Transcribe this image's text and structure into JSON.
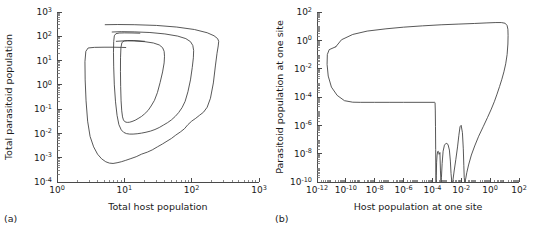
{
  "figure": {
    "background": "#ffffff",
    "line_color": "#3a3a3a",
    "axis_color": "#4a4a4a"
  },
  "panels": [
    {
      "id": "a",
      "label": "(a)",
      "xlabel": "Total host population",
      "ylabel": "Total parasitoid population",
      "xticks": [
        "10^0",
        "10^1",
        "10^2",
        "10^3"
      ],
      "yticks": [
        "10^-4",
        "10^-3",
        "10^-2",
        "10^-1",
        "10^0",
        "10^1",
        "10^2",
        "10^3"
      ]
    },
    {
      "id": "b",
      "label": "(b)",
      "xlabel": "Host population at one site",
      "ylabel": "Parasitoid population at one site",
      "xticks": [
        "10^-12",
        "10^-10",
        "10^-8",
        "10^-6",
        "10^-4",
        "10^-2",
        "10^0",
        "10^2"
      ],
      "yticks": [
        "10^-10",
        "10^-8",
        "10^-6",
        "10^-4",
        "10^-2",
        "10^0",
        "10^2"
      ]
    }
  ],
  "chart_data": [
    {
      "type": "line",
      "panel": "a",
      "title": "",
      "xlabel": "Total host population",
      "ylabel": "Total parasitoid population",
      "xscale": "log",
      "yscale": "log",
      "xlim": [
        1,
        1000
      ],
      "ylim": [
        0.0001,
        1000
      ],
      "xtick_values": [
        1,
        10,
        100,
        1000
      ],
      "ytick_values": [
        0.0001,
        0.001,
        0.01,
        0.1,
        1,
        10,
        100,
        1000
      ],
      "grid": false,
      "legend": null,
      "series": [
        {
          "name": "outer trajectory loop",
          "points": [
            [
              5.2,
              300
            ],
            [
              8,
              305
            ],
            [
              14,
              300
            ],
            [
              30,
              280
            ],
            [
              60,
              240
            ],
            [
              110,
              190
            ],
            [
              170,
              140
            ],
            [
              215,
              105
            ],
            [
              243,
              80
            ],
            [
              252,
              62
            ],
            [
              248,
              40
            ],
            [
              238,
              20
            ],
            [
              225,
              6
            ],
            [
              210,
              1.2
            ],
            [
              190,
              0.28
            ],
            [
              170,
              0.12
            ],
            [
              150,
              0.075
            ],
            [
              130,
              0.055
            ],
            [
              115,
              0.042
            ],
            [
              100,
              0.032
            ],
            [
              88,
              0.023
            ],
            [
              78,
              0.0155
            ],
            [
              68,
              0.0115
            ],
            [
              58,
              0.0085
            ],
            [
              50,
              0.0062
            ],
            [
              43,
              0.0048
            ],
            [
              37,
              0.0037
            ],
            [
              31,
              0.0028
            ],
            [
              26,
              0.0021
            ],
            [
              22,
              0.0017
            ],
            [
              18,
              0.0014
            ],
            [
              15,
              0.0011
            ],
            [
              12.5,
              0.00092
            ],
            [
              10.5,
              0.00078
            ],
            [
              9,
              0.00068
            ],
            [
              7.8,
              0.00062
            ],
            [
              6.8,
              0.00058
            ],
            [
              6.0,
              0.0006
            ],
            [
              5.3,
              0.00068
            ],
            [
              4.6,
              0.0009
            ],
            [
              4.0,
              0.0014
            ],
            [
              3.5,
              0.0028
            ],
            [
              3.1,
              0.0075
            ],
            [
              2.85,
              0.032
            ],
            [
              2.7,
              0.22
            ],
            [
              2.62,
              1.6
            ],
            [
              2.6,
              9.0
            ],
            [
              2.68,
              24
            ],
            [
              2.9,
              33
            ],
            [
              3.6,
              35
            ],
            [
              5.0,
              35.5
            ],
            [
              7.0,
              35.5
            ],
            [
              9.0,
              35.0
            ],
            [
              10.5,
              34.5
            ]
          ]
        },
        {
          "name": "middle trajectory loop",
          "points": [
            [
              6.6,
              150
            ],
            [
              9,
              155
            ],
            [
              14,
              152
            ],
            [
              24,
              143
            ],
            [
              40,
              125
            ],
            [
              62,
              102
            ],
            [
              82,
              80
            ],
            [
              96,
              60
            ],
            [
              104,
              42
            ],
            [
              107,
              26
            ],
            [
              106,
              13
            ],
            [
              102,
              5.2
            ],
            [
              96,
              1.6
            ],
            [
              88,
              0.52
            ],
            [
              80,
              0.21
            ],
            [
              72,
              0.115
            ],
            [
              64,
              0.072
            ],
            [
              57,
              0.05
            ],
            [
              50,
              0.036
            ],
            [
              44,
              0.028
            ],
            [
              38,
              0.022
            ],
            [
              33,
              0.0175
            ],
            [
              28.5,
              0.0145
            ],
            [
              24.5,
              0.0125
            ],
            [
              21,
              0.0112
            ],
            [
              18,
              0.0103
            ],
            [
              15.5,
              0.0097
            ],
            [
              13.5,
              0.0094
            ],
            [
              12,
              0.0094
            ],
            [
              10.8,
              0.0098
            ],
            [
              9.8,
              0.011
            ],
            [
              9.0,
              0.014
            ],
            [
              8.3,
              0.023
            ],
            [
              7.8,
              0.055
            ],
            [
              7.4,
              0.2
            ],
            [
              7.1,
              1.0
            ],
            [
              6.95,
              5.5
            ],
            [
              6.9,
              22
            ],
            [
              6.95,
              60
            ],
            [
              7.1,
              105
            ],
            [
              7.5,
              128
            ],
            [
              8.4,
              136
            ],
            [
              10,
              138
            ],
            [
              13,
              137
            ],
            [
              17,
              134
            ]
          ]
        },
        {
          "name": "inner trajectory loop",
          "points": [
            [
              7.6,
              62
            ],
            [
              10,
              65
            ],
            [
              14,
              64
            ],
            [
              20,
              60
            ],
            [
              27,
              53
            ],
            [
              33,
              44
            ],
            [
              37,
              34
            ],
            [
              39,
              24
            ],
            [
              39.5,
              15
            ],
            [
              39,
              8
            ],
            [
              37,
              3.4
            ],
            [
              34,
              1.25
            ],
            [
              31,
              0.48
            ],
            [
              28,
              0.23
            ],
            [
              25,
              0.135
            ],
            [
              22.5,
              0.088
            ],
            [
              20,
              0.064
            ],
            [
              18,
              0.05
            ],
            [
              16,
              0.041
            ],
            [
              14.5,
              0.035
            ],
            [
              13,
              0.031
            ],
            [
              12,
              0.029
            ],
            [
              11.2,
              0.0285
            ],
            [
              10.6,
              0.029
            ],
            [
              10.1,
              0.031
            ],
            [
              9.7,
              0.036
            ],
            [
              9.4,
              0.048
            ],
            [
              9.15,
              0.085
            ],
            [
              8.95,
              0.22
            ],
            [
              8.82,
              0.85
            ],
            [
              8.76,
              3.6
            ],
            [
              8.78,
              13
            ],
            [
              8.9,
              34
            ],
            [
              9.2,
              55
            ],
            [
              9.9,
              64
            ],
            [
              11.2,
              67
            ],
            [
              13.5,
              67
            ],
            [
              16.5,
              65
            ],
            [
              20,
              62
            ]
          ]
        }
      ]
    },
    {
      "type": "line",
      "panel": "b",
      "title": "",
      "xlabel": "Host population at one site",
      "ylabel": "Parasitoid population at one site",
      "xscale": "log",
      "yscale": "log",
      "xlim": [
        1e-12,
        100
      ],
      "ylim": [
        1e-10,
        100
      ],
      "xtick_values": [
        1e-12,
        1e-10,
        1e-08,
        1e-06,
        0.0001,
        0.01,
        1,
        100
      ],
      "ytick_values": [
        1e-10,
        1e-08,
        1e-06,
        0.0001,
        0.01,
        1,
        100
      ],
      "grid": false,
      "legend": null,
      "series": [
        {
          "name": "single-site trajectory",
          "points": [
            [
              2e-11,
              0.35
            ],
            [
              5e-11,
              1.1
            ],
            [
              3e-10,
              2.6
            ],
            [
              3e-09,
              4.5
            ],
            [
              6e-08,
              6.5
            ],
            [
              1e-06,
              8.5
            ],
            [
              2e-05,
              10.5
            ],
            [
              0.0004,
              12.5
            ],
            [
              0.006,
              14.0
            ],
            [
              0.08,
              15.5
            ],
            [
              0.6,
              17.0
            ],
            [
              2.5,
              18.0
            ],
            [
              6.0,
              18.0
            ],
            [
              11,
              16.0
            ],
            [
              15,
              11.0
            ],
            [
              17,
              6.0
            ],
            [
              17.5,
              2.2
            ],
            [
              17.0,
              0.55
            ],
            [
              15.0,
              0.1
            ],
            [
              12.0,
              0.022
            ],
            [
              9.0,
              0.006
            ],
            [
              6.5,
              0.0018
            ],
            [
              4.5,
              0.00055
            ],
            [
              3.0,
              0.00016
            ],
            [
              2.0,
              5e-05
            ],
            [
              1.2,
              1.4e-05
            ],
            [
              0.65,
              3.5e-06
            ],
            [
              0.33,
              8e-07
            ],
            [
              0.16,
              1.7e-07
            ],
            [
              0.085,
              3.5e-08
            ],
            [
              0.05,
              8e-09
            ],
            [
              0.032,
              1.6e-09
            ],
            [
              0.024,
              4.5e-10
            ],
            [
              0.02,
              1.6e-10
            ],
            [
              0.0175,
              1e-10
            ],
            [
              0.016,
              2e-10
            ],
            [
              0.015,
              1.4e-09
            ],
            [
              0.0138,
              2.2e-08
            ],
            [
              0.012,
              3e-07
            ],
            [
              0.0098,
              1e-06
            ],
            [
              0.0082,
              8e-07
            ],
            [
              0.0068,
              2e-07
            ],
            [
              0.0055,
              3e-08
            ],
            [
              0.0042,
              4e-09
            ],
            [
              0.0032,
              6e-10
            ],
            [
              0.0026,
              1.2e-10
            ],
            [
              0.0022,
              1e-10
            ],
            [
              0.00195,
              4e-10
            ],
            [
              0.00175,
              3e-09
            ],
            [
              0.0015,
              1.8e-08
            ],
            [
              0.0012,
              4.5e-08
            ],
            [
              0.0009,
              5.5e-08
            ],
            [
              0.00068,
              4e-08
            ],
            [
              0.00055,
              1.5e-08
            ],
            [
              0.00047,
              2e-09
            ],
            [
              0.00042,
              2e-10
            ],
            [
              0.00039,
              1e-10
            ],
            [
              0.00036,
              6e-10
            ],
            [
              0.00033,
              1.2e-08
            ],
            [
              0.00031,
              1e-08
            ],
            [
              0.00029,
              9e-09
            ],
            [
              0.00027,
              1.2e-08
            ],
            [
              0.00025,
              1.5e-08
            ],
            [
              0.00023,
              1.4e-08
            ],
            [
              0.00021,
              8e-09
            ],
            [
              0.000195,
              2.5e-09
            ],
            [
              0.000185,
              3e-10
            ],
            [
              0.000178,
              1e-10
            ],
            [
              0.000172,
              5e-10
            ],
            [
              0.000168,
              2e-08
            ],
            [
              0.000163,
              8e-07
            ],
            [
              0.000158,
              1.2e-05
            ],
            [
              0.000152,
              4e-05
            ],
            [
              0.00014,
              4.2e-05
            ],
            [
              1e-05,
              4.2e-05
            ],
            [
              1e-06,
              4.2e-05
            ],
            [
              1e-07,
              4.2e-05
            ],
            [
              1e-08,
              4.2e-05
            ],
            [
              1e-09,
              4.2e-05
            ],
            [
              3e-10,
              4.3e-05
            ],
            [
              8e-11,
              5.5e-05
            ],
            [
              2.5e-11,
              0.00013
            ],
            [
              1e-11,
              0.0005
            ],
            [
              6e-12,
              0.003
            ],
            [
              5e-12,
              0.02
            ],
            [
              5.2e-12,
              0.1
            ],
            [
              7e-12,
              0.22
            ],
            [
              2e-11,
              0.35
            ]
          ]
        }
      ]
    }
  ]
}
